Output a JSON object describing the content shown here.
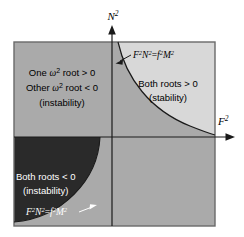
{
  "figure": {
    "axes": {
      "x_label": "F",
      "x_label_sup": "2",
      "y_label": "N",
      "y_label_sup": "2"
    },
    "regions": [
      {
        "id": "upper-left",
        "quadrant": "upper-left",
        "fill": "#aaaaaa",
        "lines": [
          {
            "pre": "One ",
            "ital": "ω",
            "sup": "2",
            "post": " root > 0"
          },
          {
            "pre": "Other ",
            "ital": "ω",
            "sup": "2",
            "post": " root < 0"
          },
          {
            "pre": "(instability)",
            "ital": "",
            "sup": "",
            "post": ""
          }
        ]
      },
      {
        "id": "upper-right",
        "quadrant": "upper-right",
        "fill": "#d8d8d8",
        "lines": [
          {
            "pre": "Both roots > 0",
            "ital": "",
            "sup": "",
            "post": ""
          },
          {
            "pre": "(stability)",
            "ital": "",
            "sup": "",
            "post": ""
          }
        ]
      },
      {
        "id": "lower-left",
        "quadrant": "lower-left",
        "fill": "#2a2a2a",
        "lines": [
          {
            "pre": "Both roots < 0",
            "ital": "",
            "sup": "",
            "post": ""
          },
          {
            "pre": "(instability)",
            "ital": "",
            "sup": "",
            "post": ""
          }
        ]
      },
      {
        "id": "lower-right",
        "quadrant": "lower-right",
        "fill": "#aaaaaa",
        "lines": []
      }
    ],
    "curves": [
      {
        "id": "upper-hyperbola",
        "label_parts": {
          "f1": "F",
          "s1": "2",
          "n1": "N",
          "s2": "2",
          "eq": "=",
          "f2": "f",
          "s3": "2",
          "m1": "M",
          "s4": "2"
        },
        "label_color": "#000000",
        "arrow_color": "#000000"
      },
      {
        "id": "lower-hyperbola",
        "label_parts": {
          "f1": "F",
          "s1": "2",
          "n1": "N",
          "s2": "2",
          "eq": "=",
          "f2": "f",
          "s3": "2",
          "m1": "M",
          "s4": "2"
        },
        "label_color": "#ffffff",
        "arrow_color": "#ffffff"
      }
    ],
    "colors": {
      "background": "#ffffff",
      "mid_gray": "#aaaaaa",
      "light_gray": "#d8d8d8",
      "dark": "#2a2a2a",
      "line": "#1a1a1a",
      "border": "#555555"
    }
  }
}
